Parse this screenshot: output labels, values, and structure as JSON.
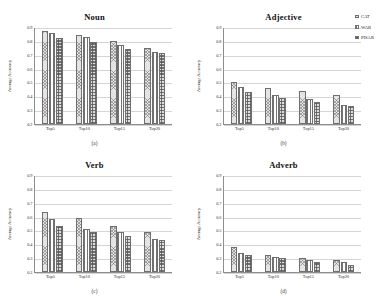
{
  "figure": {
    "layout": "2x2-grid",
    "legend_position": "top-right of panel (b)"
  },
  "legend": {
    "entries": [
      {
        "label": "CAT",
        "pattern": "diagonal-crosshatch"
      },
      {
        "label": "WAR",
        "pattern": "vertical-lines"
      },
      {
        "label": "PISAR",
        "pattern": "dense-grid"
      }
    ]
  },
  "axis": {
    "ylabel": "Average Accuracy",
    "yticks": [
      "0.2",
      "0.3",
      "0.4",
      "0.5",
      "0.6",
      "0.7",
      "0.8",
      "0.9"
    ],
    "categories": [
      "Top5",
      "Top10",
      "Top15",
      "Top20"
    ]
  },
  "panels": [
    {
      "title": "Noun",
      "caption": "(a)"
    },
    {
      "title": "Adjective",
      "caption": "(b)"
    },
    {
      "title": "Verb",
      "caption": "(c)"
    },
    {
      "title": "Adverb",
      "caption": "(d)"
    }
  ],
  "chart_data": [
    {
      "type": "bar",
      "title": "Noun",
      "caption": "(a)",
      "categories": [
        "Top5",
        "Top10",
        "Top15",
        "Top20"
      ],
      "series": [
        {
          "name": "CAT",
          "values": [
            0.87,
            0.84,
            0.8,
            0.75
          ]
        },
        {
          "name": "WAR",
          "values": [
            0.86,
            0.83,
            0.77,
            0.72
          ]
        },
        {
          "name": "PISAR",
          "values": [
            0.82,
            0.79,
            0.74,
            0.71
          ]
        }
      ],
      "xlabel": "",
      "ylabel": "Average Accuracy",
      "ylim": [
        0.2,
        0.9
      ],
      "grid": true,
      "legend": [
        "CAT",
        "WAR",
        "PISAR"
      ]
    },
    {
      "type": "bar",
      "title": "Adjective",
      "caption": "(b)",
      "categories": [
        "Top5",
        "Top10",
        "Top15",
        "Top20"
      ],
      "series": [
        {
          "name": "CAT",
          "values": [
            0.5,
            0.46,
            0.44,
            0.41
          ]
        },
        {
          "name": "WAR",
          "values": [
            0.47,
            0.41,
            0.38,
            0.34
          ]
        },
        {
          "name": "PISAR",
          "values": [
            0.43,
            0.39,
            0.36,
            0.33
          ]
        }
      ],
      "xlabel": "",
      "ylabel": "Average Accuracy",
      "ylim": [
        0.2,
        0.9
      ],
      "grid": true,
      "legend": [
        "CAT",
        "WAR",
        "PISAR"
      ]
    },
    {
      "type": "bar",
      "title": "Verb",
      "caption": "(c)",
      "categories": [
        "Top5",
        "Top10",
        "Top15",
        "Top20"
      ],
      "series": [
        {
          "name": "CAT",
          "values": [
            0.63,
            0.59,
            0.53,
            0.49
          ]
        },
        {
          "name": "WAR",
          "values": [
            0.58,
            0.51,
            0.49,
            0.44
          ]
        },
        {
          "name": "PISAR",
          "values": [
            0.53,
            0.49,
            0.46,
            0.43
          ]
        }
      ],
      "xlabel": "",
      "ylabel": "Average Accuracy",
      "ylim": [
        0.2,
        0.9
      ],
      "grid": true,
      "legend": [
        "CAT",
        "WAR",
        "PISAR"
      ]
    },
    {
      "type": "bar",
      "title": "Adverb",
      "caption": "(d)",
      "categories": [
        "Top5",
        "Top10",
        "Top15",
        "Top20"
      ],
      "series": [
        {
          "name": "CAT",
          "values": [
            0.38,
            0.32,
            0.3,
            0.29
          ]
        },
        {
          "name": "WAR",
          "values": [
            0.34,
            0.31,
            0.29,
            0.27
          ]
        },
        {
          "name": "PISAR",
          "values": [
            0.32,
            0.3,
            0.27,
            0.25
          ]
        }
      ],
      "xlabel": "",
      "ylabel": "Average Accuracy",
      "ylim": [
        0.2,
        0.9
      ],
      "grid": true,
      "legend": [
        "CAT",
        "WAR",
        "PISAR"
      ]
    }
  ]
}
